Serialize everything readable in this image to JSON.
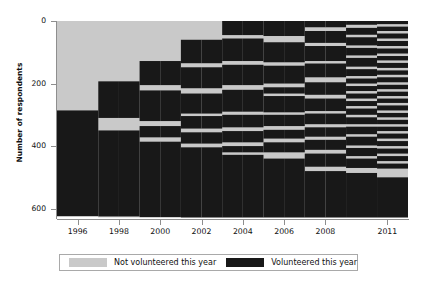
{
  "chart_data": {
    "type": "heatmap",
    "title": "",
    "xlabel": "",
    "ylabel": "Number of respondents",
    "xlim": [
      1995,
      2012
    ],
    "ylim": [
      0,
      630
    ],
    "y_inverted": true,
    "grid": false,
    "x_tick_labels": [
      "1996",
      "1998",
      "2000",
      "2002",
      "2004",
      "2006",
      "2008",
      "2011"
    ],
    "x_tick_values": [
      1996,
      1998,
      2000,
      2002,
      2004,
      2006,
      2008,
      2011
    ],
    "y_tick_labels": [
      "0",
      "200",
      "400",
      "600"
    ],
    "y_tick_values": [
      0,
      200,
      400,
      600
    ],
    "legend": {
      "position": "bottom",
      "entries": [
        {
          "label": "Not volunteered this year",
          "color": "#c9c9c9"
        },
        {
          "label": "Volunteered this year",
          "color": "#181818"
        }
      ]
    },
    "categories": [
      "Not volunteered this year",
      "Volunteered this year"
    ],
    "colors": {
      "not_volunteered": "#c9c9c9",
      "volunteered": "#181818",
      "axis": "#8e8e8e",
      "background": "#ffffff"
    },
    "columns": [
      {
        "year": 1996,
        "x0": 1995.0,
        "x1": 1997.0
      },
      {
        "year": 1997,
        "x0": 1997.0,
        "x1": 1998.0
      },
      {
        "year": 1998,
        "x0": 1998.0,
        "x1": 1999.0
      },
      {
        "year": 1999,
        "x0": 1999.0,
        "x1": 2000.0
      },
      {
        "year": 2000,
        "x0": 2000.0,
        "x1": 2001.0
      },
      {
        "year": 2001,
        "x0": 2001.0,
        "x1": 2002.0
      },
      {
        "year": 2002,
        "x0": 2002.0,
        "x1": 2003.0
      },
      {
        "year": 2003,
        "x0": 2003.0,
        "x1": 2004.0
      },
      {
        "year": 2004,
        "x0": 2004.0,
        "x1": 2005.0
      },
      {
        "year": 2005,
        "x0": 2005.0,
        "x1": 2006.0
      },
      {
        "year": 2006,
        "x0": 2006.0,
        "x1": 2007.0
      },
      {
        "year": 2007,
        "x0": 2007.0,
        "x1": 2008.0
      },
      {
        "year": 2008,
        "x0": 2008.0,
        "x1": 2009.0
      },
      {
        "year": 2009,
        "x0": 2009.0,
        "x1": 2010.5
      },
      {
        "year": 2011,
        "x0": 2010.5,
        "x1": 2012.0
      }
    ],
    "volunteered_bands": [
      {
        "col": 0,
        "bands": [
          [
            286,
            625
          ]
        ]
      },
      {
        "col": 1,
        "bands": [
          [
            193,
            310
          ],
          [
            350,
            625
          ]
        ]
      },
      {
        "col": 2,
        "bands": [
          [
            193,
            310
          ],
          [
            350,
            625
          ]
        ]
      },
      {
        "col": 3,
        "bands": [
          [
            128,
            205
          ],
          [
            222,
            320
          ],
          [
            336,
            372
          ],
          [
            386,
            628
          ]
        ]
      },
      {
        "col": 4,
        "bands": [
          [
            128,
            205
          ],
          [
            222,
            320
          ],
          [
            336,
            372
          ],
          [
            386,
            628
          ]
        ]
      },
      {
        "col": 5,
        "bands": [
          [
            60,
            135
          ],
          [
            148,
            215
          ],
          [
            232,
            296
          ],
          [
            304,
            344
          ],
          [
            356,
            392
          ],
          [
            404,
            628
          ]
        ]
      },
      {
        "col": 6,
        "bands": [
          [
            60,
            135
          ],
          [
            148,
            215
          ],
          [
            232,
            296
          ],
          [
            304,
            344
          ],
          [
            356,
            392
          ],
          [
            404,
            628
          ]
        ]
      },
      {
        "col": 7,
        "bands": [
          [
            0,
            45
          ],
          [
            56,
            128
          ],
          [
            140,
            205
          ],
          [
            220,
            290
          ],
          [
            300,
            340
          ],
          [
            352,
            388
          ],
          [
            400,
            420
          ],
          [
            428,
            628
          ]
        ]
      },
      {
        "col": 8,
        "bands": [
          [
            0,
            45
          ],
          [
            56,
            128
          ],
          [
            140,
            205
          ],
          [
            220,
            290
          ],
          [
            300,
            340
          ],
          [
            352,
            388
          ],
          [
            400,
            420
          ],
          [
            428,
            628
          ]
        ]
      },
      {
        "col": 9,
        "bands": [
          [
            0,
            48
          ],
          [
            68,
            132
          ],
          [
            143,
            200
          ],
          [
            212,
            232
          ],
          [
            240,
            292
          ],
          [
            300,
            336
          ],
          [
            348,
            376
          ],
          [
            388,
            420
          ],
          [
            440,
            628
          ]
        ]
      },
      {
        "col": 10,
        "bands": [
          [
            0,
            48
          ],
          [
            68,
            132
          ],
          [
            143,
            200
          ],
          [
            212,
            232
          ],
          [
            240,
            292
          ],
          [
            300,
            336
          ],
          [
            348,
            376
          ],
          [
            388,
            420
          ],
          [
            440,
            628
          ]
        ]
      },
      {
        "col": 11,
        "bands": [
          [
            0,
            20
          ],
          [
            32,
            70
          ],
          [
            80,
            128
          ],
          [
            136,
            180
          ],
          [
            196,
            236
          ],
          [
            248,
            288
          ],
          [
            296,
            330
          ],
          [
            340,
            370
          ],
          [
            380,
            412
          ],
          [
            424,
            466
          ],
          [
            480,
            628
          ]
        ]
      },
      {
        "col": 12,
        "bands": [
          [
            0,
            20
          ],
          [
            32,
            70
          ],
          [
            80,
            128
          ],
          [
            136,
            180
          ],
          [
            196,
            236
          ],
          [
            248,
            288
          ],
          [
            296,
            330
          ],
          [
            340,
            370
          ],
          [
            380,
            412
          ],
          [
            424,
            466
          ],
          [
            480,
            628
          ]
        ]
      },
      {
        "col": 13,
        "bands": [
          [
            0,
            12
          ],
          [
            22,
            44
          ],
          [
            52,
            78
          ],
          [
            86,
            110
          ],
          [
            118,
            146
          ],
          [
            154,
            176
          ],
          [
            184,
            200
          ],
          [
            208,
            224
          ],
          [
            232,
            248
          ],
          [
            256,
            272
          ],
          [
            280,
            300
          ],
          [
            308,
            330
          ],
          [
            338,
            362
          ],
          [
            370,
            398
          ],
          [
            406,
            432
          ],
          [
            440,
            470
          ],
          [
            486,
            628
          ]
        ]
      },
      {
        "col": 14,
        "bands": [
          [
            0,
            10
          ],
          [
            18,
            32
          ],
          [
            40,
            56
          ],
          [
            64,
            80
          ],
          [
            88,
            104
          ],
          [
            112,
            126
          ],
          [
            134,
            150
          ],
          [
            158,
            172
          ],
          [
            180,
            196
          ],
          [
            204,
            218
          ],
          [
            226,
            240
          ],
          [
            248,
            262
          ],
          [
            270,
            286
          ],
          [
            294,
            308
          ],
          [
            316,
            330
          ],
          [
            338,
            352
          ],
          [
            360,
            376
          ],
          [
            384,
            400
          ],
          [
            408,
            424
          ],
          [
            432,
            448
          ],
          [
            456,
            472
          ],
          [
            500,
            628
          ]
        ]
      }
    ]
  },
  "legend": {
    "entries": [
      {
        "label": "Not volunteered this year"
      },
      {
        "label": "Volunteered this year"
      }
    ]
  },
  "axes": {
    "ylabel": "Number of respondents"
  }
}
